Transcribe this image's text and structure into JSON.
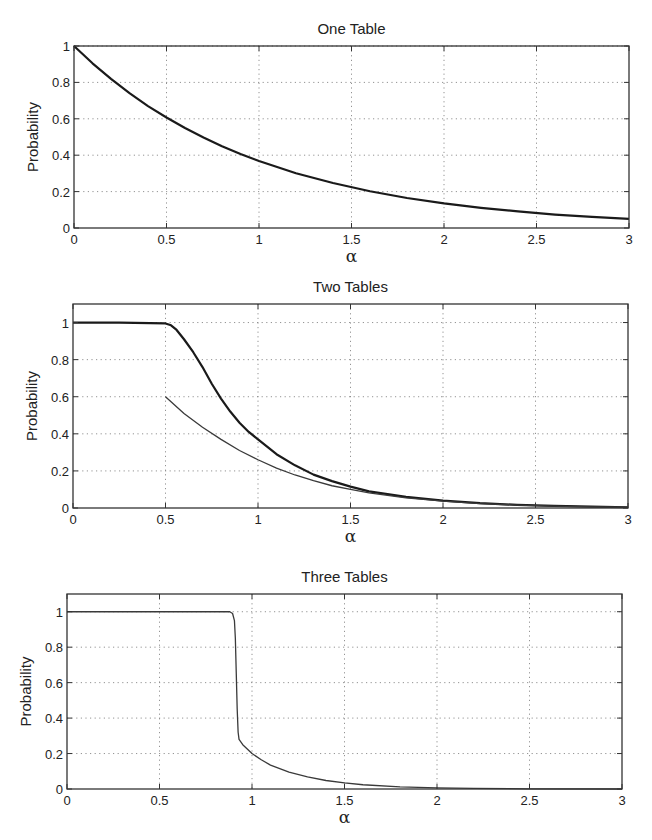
{
  "figure": {
    "panels": [
      {
        "id": "one-table",
        "title": "One Table",
        "box": {
          "left": 74,
          "top": 46,
          "right": 629,
          "bottom": 228
        },
        "ylim": [
          0,
          1
        ],
        "xlim": [
          0,
          3
        ]
      },
      {
        "id": "two-tables",
        "title": "Two Tables",
        "box": {
          "left": 73,
          "top": 304,
          "right": 628,
          "bottom": 508
        },
        "ylim": [
          0,
          1.1
        ],
        "xlim": [
          0,
          3
        ]
      },
      {
        "id": "three-tables",
        "title": "Three Tables",
        "box": {
          "left": 67,
          "top": 594,
          "right": 622,
          "bottom": 789
        },
        "ylim": [
          0,
          1.1
        ],
        "xlim": [
          0,
          3
        ]
      }
    ],
    "xticks": [
      0,
      0.5,
      1,
      1.5,
      2,
      2.5,
      3
    ],
    "xtick_labels": [
      "0",
      "0.5",
      "1",
      "1.5",
      "2",
      "2.5",
      "3"
    ],
    "yticks": [
      0,
      0.2,
      0.4,
      0.6,
      0.8,
      1
    ],
    "ytick_labels": [
      "0",
      "0.2",
      "0.4",
      "0.6",
      "0.8",
      "1"
    ],
    "xlabel": "α",
    "ylabel": "Probability"
  },
  "chart_data": [
    {
      "type": "line",
      "title": "One Table",
      "xlabel": "α",
      "ylabel": "Probability",
      "xlim": [
        0,
        3
      ],
      "ylim": [
        0,
        1
      ],
      "grid": true,
      "series": [
        {
          "name": "probability",
          "style": "thick",
          "x": [
            0,
            0.1,
            0.2,
            0.3,
            0.4,
            0.5,
            0.6,
            0.7,
            0.8,
            0.9,
            1.0,
            1.2,
            1.4,
            1.6,
            1.8,
            2.0,
            2.2,
            2.4,
            2.6,
            2.8,
            3.0
          ],
          "y": [
            1.0,
            0.905,
            0.819,
            0.741,
            0.67,
            0.607,
            0.549,
            0.497,
            0.449,
            0.407,
            0.368,
            0.301,
            0.247,
            0.202,
            0.165,
            0.135,
            0.111,
            0.091,
            0.074,
            0.061,
            0.05
          ]
        }
      ]
    },
    {
      "type": "line",
      "title": "Two Tables",
      "xlabel": "α",
      "ylabel": "Probability",
      "xlim": [
        0,
        3
      ],
      "ylim": [
        0,
        1.1
      ],
      "grid": true,
      "series": [
        {
          "name": "probability (simulated)",
          "style": "thick",
          "x": [
            0,
            0.25,
            0.5,
            0.53,
            0.56,
            0.6,
            0.65,
            0.7,
            0.75,
            0.8,
            0.85,
            0.9,
            0.95,
            1.0,
            1.1,
            1.2,
            1.3,
            1.4,
            1.5,
            1.6,
            1.8,
            2.0,
            2.2,
            2.4,
            2.6,
            2.8,
            3.0
          ],
          "y": [
            1.0,
            1.0,
            0.995,
            0.985,
            0.96,
            0.91,
            0.84,
            0.76,
            0.67,
            0.59,
            0.52,
            0.46,
            0.41,
            0.37,
            0.29,
            0.23,
            0.18,
            0.145,
            0.115,
            0.09,
            0.06,
            0.04,
            0.026,
            0.017,
            0.011,
            0.007,
            0.004
          ]
        },
        {
          "name": "probability (bound)",
          "style": "thin",
          "x": [
            0.5,
            0.6,
            0.7,
            0.8,
            0.9,
            1.0,
            1.1,
            1.2,
            1.3,
            1.4,
            1.5,
            1.6,
            1.8,
            2.0,
            2.2,
            2.4,
            2.6,
            2.8,
            3.0
          ],
          "y": [
            0.6,
            0.51,
            0.435,
            0.37,
            0.31,
            0.26,
            0.215,
            0.178,
            0.147,
            0.12,
            0.1,
            0.082,
            0.055,
            0.037,
            0.024,
            0.016,
            0.01,
            0.006,
            0.004
          ]
        }
      ]
    },
    {
      "type": "line",
      "title": "Three Tables",
      "xlabel": "α",
      "ylabel": "Probability",
      "xlim": [
        0,
        3
      ],
      "ylim": [
        0,
        1.1
      ],
      "grid": true,
      "series": [
        {
          "name": "probability",
          "style": "thin",
          "x": [
            0,
            0.5,
            0.88,
            0.895,
            0.905,
            0.91,
            0.915,
            0.92,
            0.925,
            0.93,
            0.95,
            1.0,
            1.05,
            1.1,
            1.2,
            1.3,
            1.4,
            1.5,
            1.6,
            1.8,
            2.0,
            2.2,
            2.5,
            3.0
          ],
          "y": [
            1.0,
            1.0,
            1.0,
            0.99,
            0.95,
            0.85,
            0.65,
            0.45,
            0.32,
            0.28,
            0.25,
            0.2,
            0.165,
            0.135,
            0.095,
            0.068,
            0.048,
            0.034,
            0.024,
            0.012,
            0.006,
            0.003,
            0.001,
            0.0
          ]
        }
      ]
    }
  ]
}
